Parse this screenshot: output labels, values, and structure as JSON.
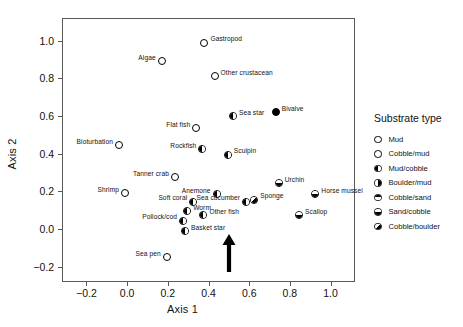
{
  "chart_data": {
    "type": "scatter",
    "title": "",
    "xlabel": "Axis 1",
    "ylabel": "Axis 2",
    "xlim": [
      -0.32,
      1.12
    ],
    "ylim": [
      -0.28,
      1.12
    ],
    "xticks": [
      "-0.2",
      "0.0",
      "0.2",
      "0.4",
      "0.6",
      "0.8",
      "1.0"
    ],
    "xtick_values": [
      -0.2,
      0.0,
      0.2,
      0.4,
      0.6,
      0.8,
      1.0
    ],
    "yticks": [
      "1.0",
      "0.8",
      "0.6",
      "0.4",
      "0.2",
      "0.0",
      "-0.2"
    ],
    "ytick_values": [
      1.0,
      0.8,
      0.6,
      0.4,
      0.2,
      0.0,
      -0.2
    ],
    "grid": false,
    "legend_position": "right",
    "points": [
      {
        "label": "Gastropod",
        "x": 0.38,
        "y": 0.99,
        "symbol": "mud",
        "label_side": "right"
      },
      {
        "label": "Algae",
        "x": 0.17,
        "y": 0.89,
        "symbol": "mud",
        "label_side": "left"
      },
      {
        "label": "Other crustacean",
        "x": 0.43,
        "y": 0.81,
        "symbol": "mud",
        "label_side": "right"
      },
      {
        "label": "Sea star",
        "x": 0.52,
        "y": 0.6,
        "symbol": "mud-cobble",
        "label_side": "right"
      },
      {
        "label": "Bivalve",
        "x": 0.73,
        "y": 0.62,
        "symbol": "cobble-mud",
        "label_side": "right"
      },
      {
        "label": "Flat fish",
        "x": 0.34,
        "y": 0.535,
        "symbol": "mud",
        "label_side": "left"
      },
      {
        "label": "Bioturbation",
        "x": -0.04,
        "y": 0.445,
        "symbol": "mud",
        "label_side": "left"
      },
      {
        "label": "Rockfish",
        "x": 0.37,
        "y": 0.425,
        "symbol": "mud-cobble",
        "label_side": "left"
      },
      {
        "label": "Sculpin",
        "x": 0.495,
        "y": 0.395,
        "symbol": "mud-cobble",
        "label_side": "right"
      },
      {
        "label": "Tanner crab",
        "x": 0.235,
        "y": 0.275,
        "symbol": "mud",
        "label_side": "left"
      },
      {
        "label": "Urchin",
        "x": 0.745,
        "y": 0.245,
        "symbol": "sand-cobble",
        "label_side": "right"
      },
      {
        "label": "Shrimp",
        "x": -0.01,
        "y": 0.19,
        "symbol": "mud",
        "label_side": "left"
      },
      {
        "label": "Anemone",
        "x": 0.44,
        "y": 0.185,
        "symbol": "mud-cobble",
        "label_side": "left"
      },
      {
        "label": "Horse mussel",
        "x": 0.925,
        "y": 0.185,
        "symbol": "sand-cobble",
        "label_side": "right"
      },
      {
        "label": "Soft coral",
        "x": 0.325,
        "y": 0.145,
        "symbol": "mud-cobble",
        "label_side": "left"
      },
      {
        "label": "Sponge",
        "x": 0.625,
        "y": 0.155,
        "symbol": "cobble-boulder",
        "label_side": "right"
      },
      {
        "label": "Sea cucumber",
        "x": 0.585,
        "y": 0.145,
        "symbol": "mud-cobble",
        "label_side": "left"
      },
      {
        "label": "Worm",
        "x": 0.295,
        "y": 0.095,
        "symbol": "mud-cobble",
        "label_side": "right"
      },
      {
        "label": "Other fish",
        "x": 0.375,
        "y": 0.075,
        "symbol": "mud-cobble",
        "label_side": "right"
      },
      {
        "label": "Scallop",
        "x": 0.845,
        "y": 0.075,
        "symbol": "sand-cobble",
        "label_side": "right"
      },
      {
        "label": "Pollock/cod",
        "x": 0.275,
        "y": 0.045,
        "symbol": "mud-cobble",
        "label_side": "left"
      },
      {
        "label": "Basket star",
        "x": 0.285,
        "y": -0.01,
        "symbol": "mud-cobble",
        "label_side": "right"
      },
      {
        "label": "Sea pen",
        "x": 0.195,
        "y": -0.15,
        "symbol": "mud",
        "label_side": "left"
      }
    ],
    "annotations": [
      {
        "type": "arrow",
        "direction": "up",
        "x": 0.46,
        "y_base": -0.21,
        "y_tip": -0.03,
        "color": "#000000"
      }
    ]
  },
  "legend": {
    "title": "Substrate type",
    "entries": [
      {
        "label": "Mud",
        "symbol": "mud"
      },
      {
        "label": "Cobble/mud",
        "symbol": "cobble-mud"
      },
      {
        "label": "Mud/cobble",
        "symbol": "mud-cobble"
      },
      {
        "label": "Boulder/mud",
        "symbol": "boulder-mud"
      },
      {
        "label": "Cobble/sand",
        "symbol": "cobble-sand"
      },
      {
        "label": "Sand/cobble",
        "symbol": "sand-cobble"
      },
      {
        "label": "Cobble/boulder",
        "symbol": "cobble-boulder"
      }
    ]
  },
  "colors": {
    "marker_stroke": "#000000",
    "marker_fill": "#ffffff",
    "axis": "#595959",
    "text": "#111111",
    "background": "#ffffff"
  }
}
